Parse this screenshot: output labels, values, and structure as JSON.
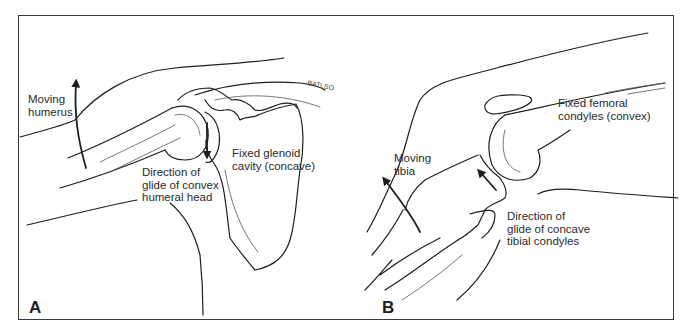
{
  "figure": {
    "panels": [
      {
        "id": "A",
        "letter": "A",
        "subject": "shoulder",
        "labels": {
          "moving": "Moving\nhumerus",
          "fixed": "Fixed glenoid\ncavity (concave)",
          "glide": "Direction of\nglide of convex\nhumeral head"
        },
        "signature": "BATLSO"
      },
      {
        "id": "B",
        "letter": "B",
        "subject": "knee",
        "labels": {
          "moving": "Moving\ntibia",
          "fixed": "Fixed femoral\ncondyles (convex)",
          "glide": "Direction of\nglide of concave\ntibial condyles"
        }
      }
    ],
    "colors": {
      "line": "#1e1e1e",
      "text": "#2a2a2a",
      "frame": "#3a3a3a",
      "background": "#ffffff"
    }
  }
}
